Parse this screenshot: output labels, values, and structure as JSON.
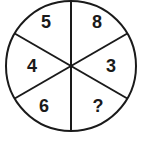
{
  "puzzle": {
    "type": "number-wheel",
    "segments": [
      {
        "position": "top-left",
        "value": "5"
      },
      {
        "position": "top-right",
        "value": "8"
      },
      {
        "position": "middle-left",
        "value": "4"
      },
      {
        "position": "middle-right",
        "value": "3"
      },
      {
        "position": "bottom-left",
        "value": "6"
      },
      {
        "position": "bottom-right",
        "value": "?"
      }
    ]
  },
  "colors": {
    "stroke": "#1a1a1a",
    "background": "#ffffff"
  }
}
